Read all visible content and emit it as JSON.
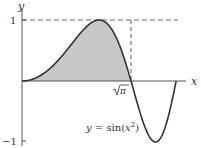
{
  "figure": {
    "axis_x_label": "x",
    "axis_y_label": "y",
    "tick_y_top": "1",
    "tick_y_bottom": "−1",
    "tick_x_label": "√π",
    "tick_x_radicand": "π",
    "curve_label_prefix": "y = sin(",
    "curve_label_var": "x",
    "curve_label_exp": "2",
    "curve_label_suffix": ")",
    "colors": {
      "curve": "#333333",
      "fill": "#c8c8c8",
      "axes": "#555555",
      "dashed": "#666666"
    }
  },
  "chart_data": {
    "type": "line",
    "title": "",
    "function": "y = sin(x^2)",
    "xlabel": "x",
    "ylabel": "y",
    "xlim": [
      0,
      2.6
    ],
    "ylim": [
      -1,
      1
    ],
    "yticks": [
      "1",
      "-1"
    ],
    "xticks": [
      "√π"
    ],
    "shaded_region": {
      "from": 0,
      "to": "√π",
      "description": "area under y = sin(x^2) between 0 and √π"
    },
    "reference_lines": [
      {
        "type": "horizontal",
        "y": 1,
        "style": "dashed"
      },
      {
        "type": "vertical",
        "x": "√π",
        "style": "dashed"
      }
    ],
    "grid": false
  }
}
